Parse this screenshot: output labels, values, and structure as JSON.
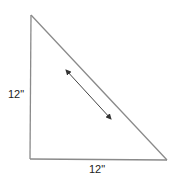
{
  "diagram": {
    "shape": "right-triangle",
    "vertices": {
      "top": [
        31,
        15
      ],
      "bottom_left": [
        30,
        159
      ],
      "bottom_right": [
        167,
        160
      ]
    },
    "labels": {
      "left_side": "12\"",
      "bottom_side": "12\""
    },
    "hypotenuse_arrow": {
      "from": [
        65,
        69
      ],
      "to": [
        112,
        120
      ],
      "double_headed": true
    },
    "colors": {
      "line": "#8a8a8a",
      "arrow": "#333333",
      "text": "#222222",
      "background": "#ffffff"
    }
  }
}
